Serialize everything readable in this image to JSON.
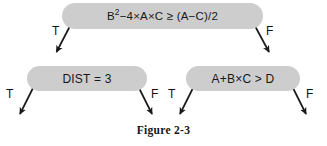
{
  "figure": {
    "caption": "Figure 2-3",
    "colors": {
      "box_fill": "#cdcdcd",
      "text": "#18181a",
      "arrow": "#1a1a1a",
      "background": "#ffffff"
    }
  },
  "diagram": {
    "type": "flowchart-decision-tree",
    "nodes": [
      {
        "id": "top",
        "shape": "rounded-rectangle",
        "expression_parts": {
          "base": "B",
          "exponent": "2",
          "rest": "−4×A×C  ≥  (A−C)/2"
        },
        "expression_plain": "B²−4×A×C ≥ (A−C)/2",
        "branches": {
          "true_label": "T",
          "false_label": "F"
        }
      },
      {
        "id": "bottom-left",
        "shape": "rounded-rectangle",
        "expression_plain": "DIST  =  3",
        "branches": {
          "true_label": "T",
          "false_label": "F"
        }
      },
      {
        "id": "bottom-right",
        "shape": "rounded-rectangle",
        "expression_plain": "A+B×C  >  D",
        "branches": {
          "true_label": "T",
          "false_label": "F"
        }
      }
    ],
    "branch_labels": {
      "top_true": "T",
      "top_false": "F",
      "bottom_left_true": "T",
      "bottom_left_false": "F",
      "bottom_right_true": "T",
      "bottom_right_false": "F"
    }
  }
}
